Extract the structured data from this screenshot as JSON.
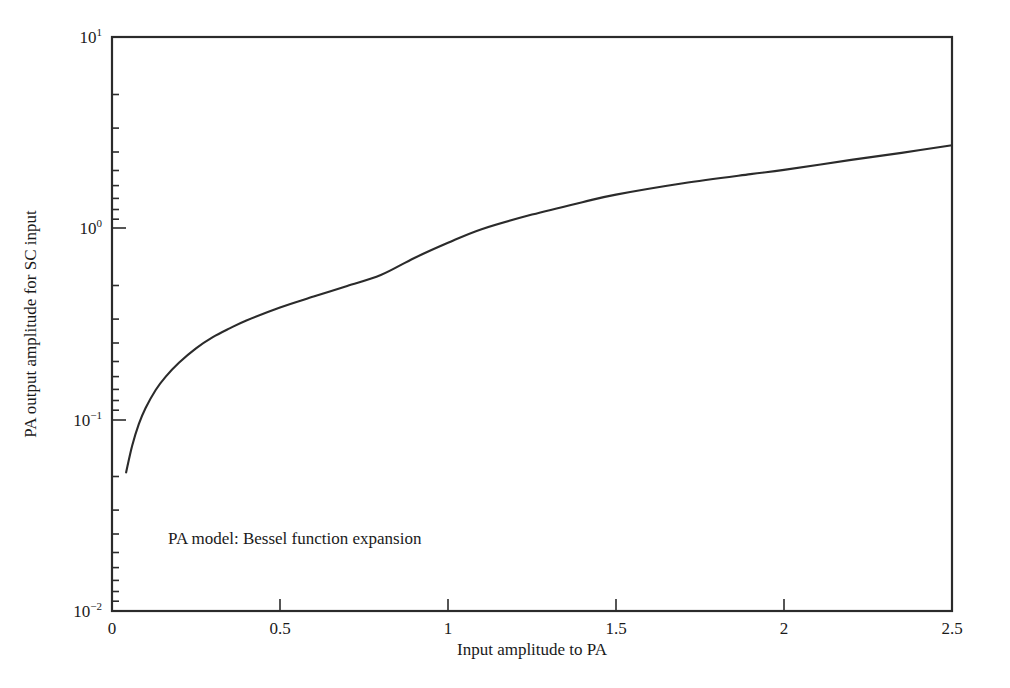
{
  "chart_data": {
    "type": "line",
    "title": "",
    "xlabel": "Input amplitude to PA",
    "ylabel": "PA output amplitude for SC input",
    "annotation": "PA model: Bessel function expansion",
    "xlim": [
      0,
      2.5
    ],
    "ylim": [
      0.01,
      10
    ],
    "yscale": "log",
    "xscale": "linear",
    "grid": false,
    "legend": null,
    "xticks": [
      "0",
      "0.5",
      "1",
      "1.5",
      "2",
      "2.5"
    ],
    "xtick_values": [
      0,
      0.5,
      1,
      1.5,
      2,
      2.5
    ],
    "ytick_labels": [
      "10",
      "10",
      "10",
      "10"
    ],
    "ytick_exponents": [
      "1",
      "0",
      "-1",
      "-2"
    ],
    "ytick_values": [
      10,
      1,
      0.1,
      0.01
    ],
    "series": [
      {
        "name": "PA output amplitude",
        "color": "#2b2b2b",
        "x": [
          0.042,
          0.06,
          0.08,
          0.1,
          0.13,
          0.16,
          0.2,
          0.25,
          0.3,
          0.35,
          0.4,
          0.5,
          0.6,
          0.7,
          0.8,
          0.9,
          1.0,
          1.1,
          1.25,
          1.4,
          1.5,
          1.7,
          1.9,
          2.0,
          2.2,
          2.35,
          2.5
        ],
        "y": [
          0.053,
          0.073,
          0.095,
          0.115,
          0.143,
          0.168,
          0.199,
          0.236,
          0.27,
          0.3,
          0.33,
          0.386,
          0.44,
          0.5,
          0.57,
          0.7,
          0.84,
          0.99,
          1.18,
          1.37,
          1.5,
          1.72,
          1.92,
          2.02,
          2.28,
          2.48,
          2.72
        ]
      }
    ]
  },
  "axes": {
    "y_axis_name": "PA output amplitude for SC input",
    "x_axis_name": "Input amplitude to PA"
  }
}
